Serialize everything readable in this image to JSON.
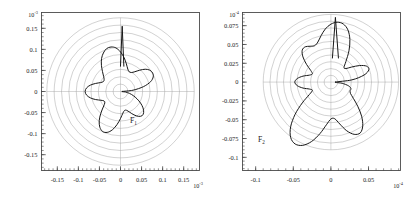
{
  "figure": {
    "background_color": "#ffffff",
    "ink_color": "#171717",
    "grid_color": "#9a9a9a",
    "frame_color": "#4a4a4a"
  },
  "chart_data": [
    {
      "type": "line",
      "subtype": "polar-radiation-pattern",
      "panel": "left",
      "title": "",
      "annotation": "F",
      "annotation_subscript": "1",
      "annotation_full": "F1",
      "xlabel": "",
      "ylabel": "",
      "x_exponent_label": "10",
      "x_exponent_sup": "-3",
      "y_exponent_label": "10",
      "y_exponent_sup": "-3",
      "xlim": [
        -0.1875,
        0.1875
      ],
      "ylim": [
        -0.1875,
        0.1875
      ],
      "xticks": [
        -0.15,
        -0.1,
        -0.05,
        0,
        0.05,
        0.1,
        0.15
      ],
      "xticklabels": [
        "-0.15",
        "-0.1",
        "-0.05",
        "0",
        "0.05",
        "0.1",
        "0.15"
      ],
      "yticks": [
        -0.15,
        -0.1,
        -0.05,
        0,
        0.05,
        0.1,
        0.15
      ],
      "yticklabels": [
        "-0.15",
        "-0.1",
        "-0.05",
        "0",
        "0.05",
        "0.1",
        "0.15"
      ],
      "grid": true,
      "grid_type": "polar-concentric-circles",
      "grid_circle_count": 10,
      "grid_circle_radii": [
        0.0175,
        0.035,
        0.0525,
        0.07,
        0.0875,
        0.105,
        0.1225,
        0.14,
        0.1575,
        0.175
      ],
      "legend": "none",
      "series": [
        {
          "name": "F1",
          "color": "#171717",
          "closed": true,
          "polar_samples_deg_r": [
            [
              0,
              0.004
            ],
            [
              6,
              0.03
            ],
            [
              12,
              0.056
            ],
            [
              18,
              0.075
            ],
            [
              24,
              0.085
            ],
            [
              30,
              0.088
            ],
            [
              36,
              0.086
            ],
            [
              42,
              0.079
            ],
            [
              48,
              0.068
            ],
            [
              54,
              0.058
            ],
            [
              60,
              0.052
            ],
            [
              66,
              0.051
            ],
            [
              72,
              0.056
            ],
            [
              78,
              0.067
            ],
            [
              84,
              0.081
            ],
            [
              90,
              0.094
            ],
            [
              96,
              0.104
            ],
            [
              102,
              0.108
            ],
            [
              108,
              0.107
            ],
            [
              114,
              0.1
            ],
            [
              120,
              0.09
            ],
            [
              126,
              0.077
            ],
            [
              132,
              0.064
            ],
            [
              138,
              0.054
            ],
            [
              144,
              0.048
            ],
            [
              150,
              0.047
            ],
            [
              156,
              0.052
            ],
            [
              162,
              0.062
            ],
            [
              168,
              0.073
            ],
            [
              174,
              0.081
            ],
            [
              180,
              0.084
            ],
            [
              186,
              0.081
            ],
            [
              192,
              0.073
            ],
            [
              198,
              0.062
            ],
            [
              204,
              0.051
            ],
            [
              210,
              0.045
            ],
            [
              216,
              0.046
            ],
            [
              222,
              0.055
            ],
            [
              228,
              0.07
            ],
            [
              234,
              0.086
            ],
            [
              240,
              0.098
            ],
            [
              246,
              0.104
            ],
            [
              252,
              0.102
            ],
            [
              258,
              0.093
            ],
            [
              264,
              0.079
            ],
            [
              270,
              0.064
            ],
            [
              276,
              0.052
            ],
            [
              282,
              0.046
            ],
            [
              288,
              0.047
            ],
            [
              294,
              0.054
            ],
            [
              300,
              0.064
            ],
            [
              306,
              0.073
            ],
            [
              312,
              0.077
            ],
            [
              318,
              0.074
            ],
            [
              324,
              0.066
            ],
            [
              330,
              0.055
            ],
            [
              336,
              0.043
            ],
            [
              342,
              0.032
            ],
            [
              348,
              0.022
            ],
            [
              354,
              0.012
            ]
          ],
          "spike": {
            "description": "vertical spike at top-center reaching y=0.155",
            "x": 0.004,
            "y_top": 0.155,
            "y_base": 0.06
          }
        }
      ]
    },
    {
      "type": "line",
      "subtype": "polar-radiation-pattern",
      "panel": "right",
      "title": "",
      "annotation": "F",
      "annotation_subscript": "2",
      "annotation_full": "F2",
      "xlabel": "",
      "ylabel": "",
      "x_exponent_label": "10",
      "x_exponent_sup": "-4",
      "y_exponent_label": "10",
      "y_exponent_sup": "-4",
      "xlim": [
        -0.1175,
        0.0925
      ],
      "ylim": [
        -0.1175,
        0.0925
      ],
      "xticks": [
        -0.1,
        -0.05,
        0,
        0.05
      ],
      "xticklabels": [
        "-0.1",
        "-0.05",
        "0",
        "0.05"
      ],
      "yticks": [
        -0.1,
        -0.075,
        -0.05,
        -0.025,
        0,
        0.025,
        0.05,
        0.075
      ],
      "yticklabels": [
        "-0.1",
        "-0.075",
        "-0.05",
        "-0.025",
        "0",
        "0.025",
        "0.05",
        "0.075"
      ],
      "grid": true,
      "grid_type": "polar-concentric-circles",
      "grid_circle_count": 10,
      "grid_circle_radii": [
        0.009,
        0.018,
        0.027,
        0.036,
        0.045,
        0.054,
        0.063,
        0.072,
        0.081,
        0.09
      ],
      "legend": "none",
      "series": [
        {
          "name": "F2",
          "color": "#171717",
          "closed": true,
          "polar_samples_deg_r": [
            [
              0,
              0.006
            ],
            [
              6,
              0.028
            ],
            [
              12,
              0.045
            ],
            [
              18,
              0.053
            ],
            [
              24,
              0.052
            ],
            [
              30,
              0.044
            ],
            [
              36,
              0.034
            ],
            [
              42,
              0.027
            ],
            [
              48,
              0.026
            ],
            [
              54,
              0.034
            ],
            [
              60,
              0.048
            ],
            [
              66,
              0.062
            ],
            [
              72,
              0.073
            ],
            [
              78,
              0.079
            ],
            [
              84,
              0.08
            ],
            [
              90,
              0.077
            ],
            [
              96,
              0.071
            ],
            [
              102,
              0.063
            ],
            [
              108,
              0.056
            ],
            [
              114,
              0.053
            ],
            [
              120,
              0.055
            ],
            [
              126,
              0.058
            ],
            [
              132,
              0.057
            ],
            [
              138,
              0.05
            ],
            [
              144,
              0.04
            ],
            [
              150,
              0.031
            ],
            [
              156,
              0.027
            ],
            [
              162,
              0.03
            ],
            [
              168,
              0.038
            ],
            [
              174,
              0.045
            ],
            [
              180,
              0.048
            ],
            [
              186,
              0.045
            ],
            [
              192,
              0.038
            ],
            [
              198,
              0.03
            ],
            [
              204,
              0.027
            ],
            [
              210,
              0.033
            ],
            [
              216,
              0.047
            ],
            [
              222,
              0.064
            ],
            [
              228,
              0.08
            ],
            [
              234,
              0.091
            ],
            [
              240,
              0.095
            ],
            [
              246,
              0.092
            ],
            [
              252,
              0.083
            ],
            [
              258,
              0.07
            ],
            [
              264,
              0.057
            ],
            [
              270,
              0.049
            ],
            [
              276,
              0.049
            ],
            [
              282,
              0.057
            ],
            [
              288,
              0.068
            ],
            [
              294,
              0.076
            ],
            [
              300,
              0.078
            ],
            [
              306,
              0.072
            ],
            [
              312,
              0.061
            ],
            [
              318,
              0.048
            ],
            [
              324,
              0.037
            ],
            [
              330,
              0.03
            ],
            [
              336,
              0.028
            ],
            [
              342,
              0.028
            ],
            [
              348,
              0.024
            ],
            [
              354,
              0.015
            ]
          ],
          "spike": {
            "description": "narrow vertical spike at top-center reaching y=0.086",
            "x": 0.006,
            "y_top": 0.086,
            "y_base": 0.032
          }
        }
      ]
    }
  ]
}
